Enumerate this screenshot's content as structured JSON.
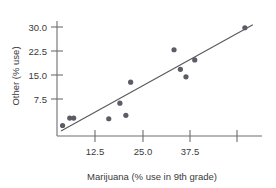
{
  "chart_data": {
    "type": "scatter",
    "title": "",
    "xlabel": "Marijuana (% use in 9th grade)",
    "ylabel": "Other (% use)",
    "xlim": [
      5.0,
      56.5
    ],
    "ylim": [
      -1.5,
      32.5
    ],
    "grid": false,
    "legend": null,
    "xticks": [
      12.5,
      25.0,
      37.5,
      50.0
    ],
    "xtick_labels": [
      "12.5",
      "25.0",
      "37.5",
      ""
    ],
    "yticks": [
      7.5,
      15.0,
      22.5,
      30.0
    ],
    "ytick_labels": [
      "7.5",
      "15.0",
      "22.5",
      "30.0"
    ],
    "marker": "filled-circle",
    "marker_color": "#5c5c66",
    "line_color": "#5a5a5a",
    "points": [
      {
        "x": 6.4,
        "y": 1.6
      },
      {
        "x": 8.2,
        "y": 3.8
      },
      {
        "x": 9.2,
        "y": 3.8
      },
      {
        "x": 18.0,
        "y": 3.6
      },
      {
        "x": 20.8,
        "y": 8.2
      },
      {
        "x": 22.3,
        "y": 4.6
      },
      {
        "x": 23.5,
        "y": 14.4
      },
      {
        "x": 34.4,
        "y": 24.0
      },
      {
        "x": 36.0,
        "y": 18.2
      },
      {
        "x": 37.4,
        "y": 16.0
      },
      {
        "x": 39.6,
        "y": 21.0
      },
      {
        "x": 52.2,
        "y": 30.5
      }
    ],
    "fit_line": {
      "type": "least-squares-regression",
      "x_start": 6.0,
      "y_start": 0.0,
      "x_end": 54.2,
      "y_end": 31.4
    }
  },
  "axes": {
    "x_axis_name": "x-axis",
    "y_axis_name": "y-axis"
  }
}
